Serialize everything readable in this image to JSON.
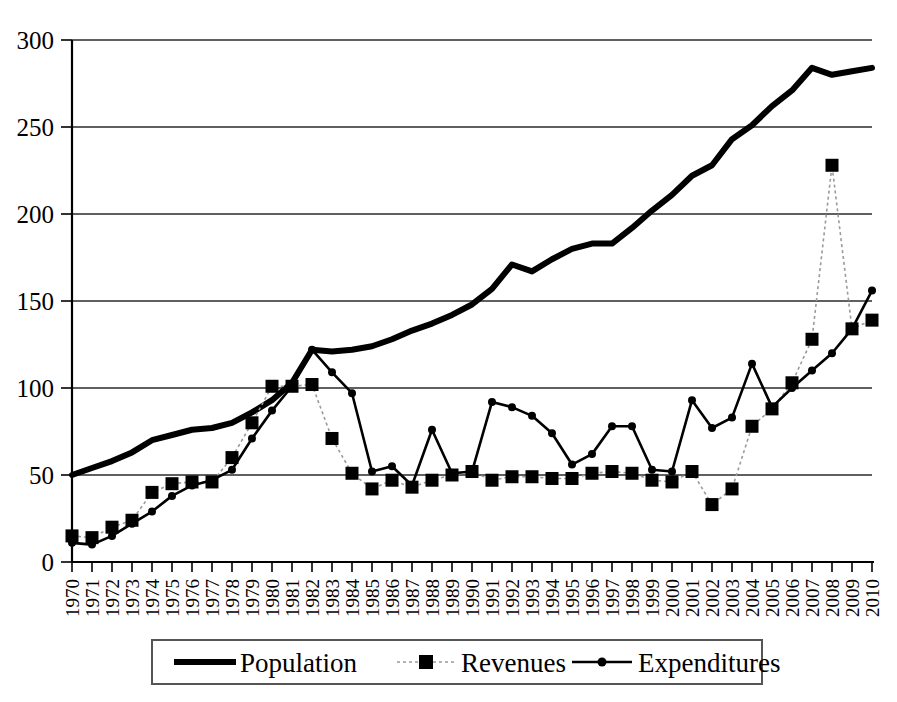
{
  "chart_data": {
    "type": "line",
    "title": "",
    "subtitle": "",
    "xlabel": "",
    "ylabel": "",
    "ylim": [
      0,
      300
    ],
    "ytick_step": 50,
    "yticks": [
      0,
      50,
      100,
      150,
      200,
      250,
      300
    ],
    "grid": true,
    "grid_axis": "y",
    "legend_position": "bottom",
    "categories": [
      "1970",
      "1971",
      "1972",
      "1973",
      "1974",
      "1975",
      "1976",
      "1977",
      "1978",
      "1979",
      "1980",
      "1981",
      "1982",
      "1983",
      "1984",
      "1985",
      "1986",
      "1987",
      "1988",
      "1989",
      "1990",
      "1991",
      "1992",
      "1993",
      "1994",
      "1995",
      "1996",
      "1997",
      "1998",
      "1999",
      "2000",
      "2001",
      "2002",
      "2003",
      "2004",
      "2005",
      "2006",
      "2007",
      "2008",
      "2009",
      "2010"
    ],
    "series": [
      {
        "name": "Population",
        "marker": "none",
        "style": "thick-solid",
        "color": "#000000",
        "values": [
          50,
          54,
          58,
          63,
          70,
          73,
          76,
          77,
          80,
          86,
          93,
          103,
          122,
          121,
          122,
          124,
          128,
          133,
          137,
          142,
          148,
          157,
          171,
          167,
          174,
          180,
          183,
          183,
          192,
          202,
          211,
          222,
          228,
          243,
          251,
          262,
          271,
          284,
          280,
          282,
          284
        ]
      },
      {
        "name": "Revenues",
        "marker": "square",
        "style": "dotted",
        "color": "#000000",
        "values": [
          15,
          14,
          20,
          24,
          40,
          45,
          46,
          46,
          60,
          80,
          101,
          101,
          102,
          71,
          51,
          42,
          47,
          43,
          47,
          50,
          52,
          47,
          49,
          49,
          48,
          48,
          51,
          52,
          51,
          47,
          46,
          52,
          33,
          42,
          78,
          88,
          103,
          128,
          228,
          134,
          139
        ]
      },
      {
        "name": "Expenditures",
        "marker": "dot",
        "style": "solid",
        "color": "#000000",
        "values": [
          11,
          10,
          15,
          22,
          29,
          38,
          44,
          47,
          53,
          71,
          87,
          101,
          122,
          109,
          97,
          52,
          55,
          44,
          76,
          51,
          52,
          92,
          89,
          84,
          74,
          56,
          62,
          78,
          78,
          53,
          52,
          93,
          77,
          83,
          114,
          89,
          100,
          110,
          120,
          134,
          156
        ]
      }
    ]
  },
  "legend": {
    "items": [
      {
        "label": "Population",
        "style": "thick-solid"
      },
      {
        "label": "Revenues",
        "style": "dotted-square"
      },
      {
        "label": "Expenditures",
        "style": "solid-dot"
      }
    ]
  },
  "axes": {
    "y_min_label": "0",
    "y_max_label": "300"
  }
}
